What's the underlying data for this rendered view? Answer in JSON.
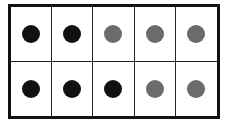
{
  "ten_frame": {
    "rows": 2,
    "columns": 5,
    "colors": {
      "black": "#111111",
      "gray": "#6b6b6b"
    },
    "cells": [
      {
        "dot": "black"
      },
      {
        "dot": "black"
      },
      {
        "dot": "gray"
      },
      {
        "dot": "gray"
      },
      {
        "dot": "gray"
      },
      {
        "dot": "black"
      },
      {
        "dot": "black"
      },
      {
        "dot": "black"
      },
      {
        "dot": "gray"
      },
      {
        "dot": "gray"
      }
    ],
    "counts": {
      "black": 5,
      "gray": 5,
      "total": 10
    }
  }
}
